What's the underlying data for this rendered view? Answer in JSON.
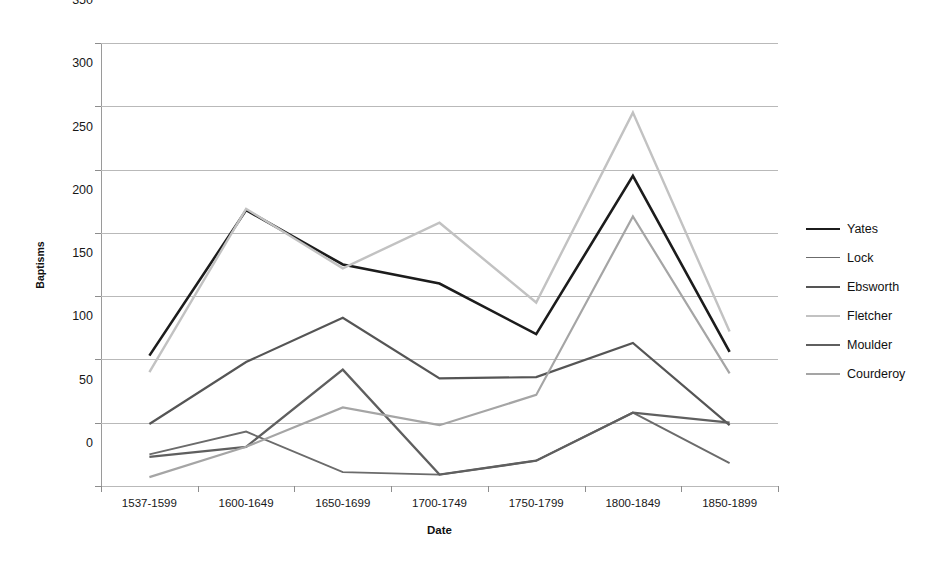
{
  "chart_data": {
    "type": "line",
    "title": "",
    "xlabel": "Date",
    "ylabel": "Baptisms",
    "categories": [
      "1537-1599",
      "1600-1649",
      "1650-1699",
      "1700-1749",
      "1750-1799",
      "1800-1849",
      "1850-1899"
    ],
    "ylim": [
      0,
      350
    ],
    "yticks": [
      0,
      50,
      100,
      150,
      200,
      250,
      300,
      350
    ],
    "grid": true,
    "legend_position": "right",
    "series": [
      {
        "name": "Yates",
        "color": "#1c1c1c",
        "width": 2.6,
        "values": [
          103,
          218,
          175,
          160,
          120,
          245,
          106
        ]
      },
      {
        "name": "Lock",
        "color": "#6b6b6b",
        "width": 1.9,
        "values": [
          25,
          43,
          11,
          9,
          20,
          58,
          18
        ]
      },
      {
        "name": "Ebsworth",
        "color": "#555555",
        "width": 2.2,
        "values": [
          49,
          98,
          133,
          85,
          86,
          113,
          48
        ]
      },
      {
        "name": "Fletcher",
        "color": "#c2c2c2",
        "width": 2.4,
        "values": [
          90,
          219,
          172,
          208,
          145,
          295,
          122
        ]
      },
      {
        "name": "Moulder",
        "color": "#5f5f5f",
        "width": 2.3,
        "values": [
          23,
          31,
          92,
          9,
          20,
          58,
          50
        ]
      },
      {
        "name": "Courderoy",
        "color": "#a5a5a5",
        "width": 2.2,
        "values": [
          7,
          31,
          62,
          48,
          72,
          213,
          89
        ]
      }
    ]
  },
  "axes": {
    "y_tick_labels": [
      "0",
      "50",
      "100",
      "150",
      "200",
      "250",
      "300",
      "350"
    ],
    "x_tick_labels": [
      "1537-1599",
      "1600-1649",
      "1650-1699",
      "1700-1749",
      "1750-1799",
      "1800-1849",
      "1850-1899"
    ],
    "x_title": "Date",
    "y_title": "Baptisms"
  },
  "legend": {
    "items": [
      {
        "label": "Yates"
      },
      {
        "label": "Lock"
      },
      {
        "label": "Ebsworth"
      },
      {
        "label": "Fletcher"
      },
      {
        "label": "Moulder"
      },
      {
        "label": "Courderoy"
      }
    ]
  }
}
